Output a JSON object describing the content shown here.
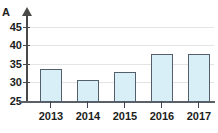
{
  "chart_data": {
    "type": "bar",
    "title": "",
    "subtitle": "",
    "xlabel": "",
    "ylabel": "A",
    "categories": [
      "2013",
      "2014",
      "2015",
      "2016",
      "2017"
    ],
    "values": [
      29,
      34,
      31,
      33,
      38
    ],
    "ylim": [
      25,
      46
    ],
    "ytick_labels": [
      "25",
      "30",
      "35",
      "40",
      "45"
    ],
    "ytick_values": [
      25,
      30,
      35,
      40,
      45
    ],
    "grid": true,
    "legend": null,
    "series": [
      {
        "name": "A",
        "values": [
          29,
          34,
          31,
          33,
          38
        ]
      }
    ],
    "colors": {
      "bar_fill": "#d8eff7",
      "bar_border": "#53606c",
      "gridline": "#e3e4e6",
      "axis": "#4a4a49",
      "x_axis": "#5a6068",
      "text": "#1d1d1b"
    }
  }
}
